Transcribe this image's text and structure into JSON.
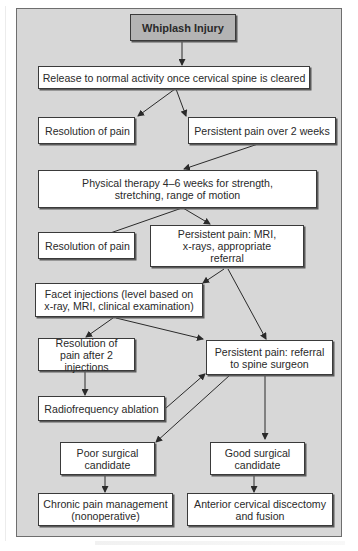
{
  "diagram": {
    "type": "flowchart",
    "title": "Whiplash Injury",
    "colors": {
      "panel_background": "#d7d7d7",
      "title_box_fill": "#b4b4b4",
      "node_fill": "#ffffff",
      "border": "#3a3a3a"
    },
    "nodes": {
      "whiplash": "Whiplash Injury",
      "release": "Release to normal activity once cervical spine is cleared",
      "resolution1": "Resolution of pain",
      "persistent_2wk": "Persistent pain over 2 weeks",
      "physical_therapy": "Physical therapy 4–6 weeks for strength, stretching, range of motion",
      "resolution2": "Resolution of pain",
      "persistent_mri": "Persistent pain: MRI, x-rays, appropriate referral",
      "facet": "Facet injections (level based on x-ray, MRI, clinical examination)",
      "resolution_after2": "Resolution of pain after 2 injections",
      "persistent_referral": "Persistent pain: referral to spine surgeon",
      "radiofrequency": "Radiofrequency ablation",
      "poor_candidate": "Poor surgical candidate",
      "good_candidate": "Good surgical candidate",
      "chronic": "Chronic pain management (nonoperative)",
      "anterior": "Anterior cervical discectomy and fusion"
    },
    "edges": [
      [
        "whiplash",
        "release"
      ],
      [
        "release",
        "resolution1"
      ],
      [
        "release",
        "persistent_2wk"
      ],
      [
        "persistent_2wk",
        "physical_therapy"
      ],
      [
        "physical_therapy",
        "resolution2"
      ],
      [
        "physical_therapy",
        "persistent_mri"
      ],
      [
        "persistent_mri",
        "facet"
      ],
      [
        "persistent_mri",
        "persistent_referral"
      ],
      [
        "facet",
        "resolution_after2"
      ],
      [
        "facet",
        "persistent_referral"
      ],
      [
        "resolution_after2",
        "radiofrequency"
      ],
      [
        "radiofrequency",
        "persistent_referral"
      ],
      [
        "persistent_referral",
        "poor_candidate"
      ],
      [
        "persistent_referral",
        "good_candidate"
      ],
      [
        "poor_candidate",
        "chronic"
      ],
      [
        "good_candidate",
        "anterior"
      ]
    ]
  }
}
